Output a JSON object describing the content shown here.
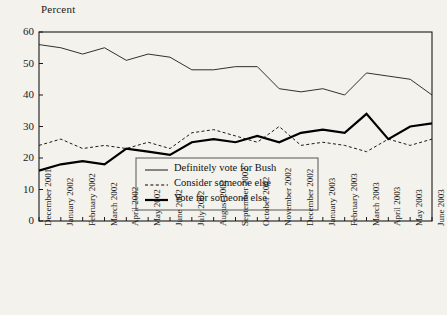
{
  "figure": {
    "axis_label": "Percent",
    "background_color": "#f4f2ec",
    "ink_color": "#1a1a1a"
  },
  "chart_data": {
    "type": "line",
    "title": "",
    "subtitle": "",
    "xlabel": "",
    "ylabel": "Percent",
    "ylim": [
      0,
      60
    ],
    "yticks": [
      0,
      10,
      20,
      30,
      40,
      50,
      60
    ],
    "grid": false,
    "legend_position": "inside-bottom-center",
    "categories": [
      "December 2001",
      "January 2002",
      "February 2002",
      "March 2002",
      "April 2002",
      "May 2002",
      "June 2002",
      "July 2002",
      "August 2002",
      "September 2002",
      "October 2002",
      "November 2002",
      "December 2002",
      "January 2003",
      "February 2003",
      "March 2003",
      "April 2003",
      "May 2003",
      "June 2003"
    ],
    "series": [
      {
        "name": "Definitely vote for Bush",
        "style": "thin-solid",
        "color": "#1a1a1a",
        "values": [
          56,
          55,
          53,
          55,
          51,
          53,
          52,
          48,
          48,
          49,
          49,
          42,
          41,
          42,
          40,
          47,
          46,
          45,
          40
        ]
      },
      {
        "name": "Consider someone else",
        "style": "dashed",
        "color": "#1a1a1a",
        "values": [
          24,
          26,
          23,
          24,
          23,
          25,
          23,
          28,
          29,
          27,
          25,
          30,
          24,
          25,
          24,
          22,
          26,
          24,
          26
        ]
      },
      {
        "name": "Vote for someone else",
        "style": "bold-solid",
        "color": "#000000",
        "values": [
          16,
          18,
          19,
          18,
          23,
          22,
          21,
          25,
          26,
          25,
          27,
          25,
          28,
          29,
          28,
          34,
          26,
          30,
          31
        ]
      }
    ],
    "annotations": []
  },
  "legend": {
    "items": [
      {
        "label": "Definitely vote for Bush",
        "style": "thin-solid"
      },
      {
        "label": "Consider someone else",
        "style": "dashed"
      },
      {
        "label": "Vote for someone else",
        "style": "bold-solid"
      }
    ]
  }
}
